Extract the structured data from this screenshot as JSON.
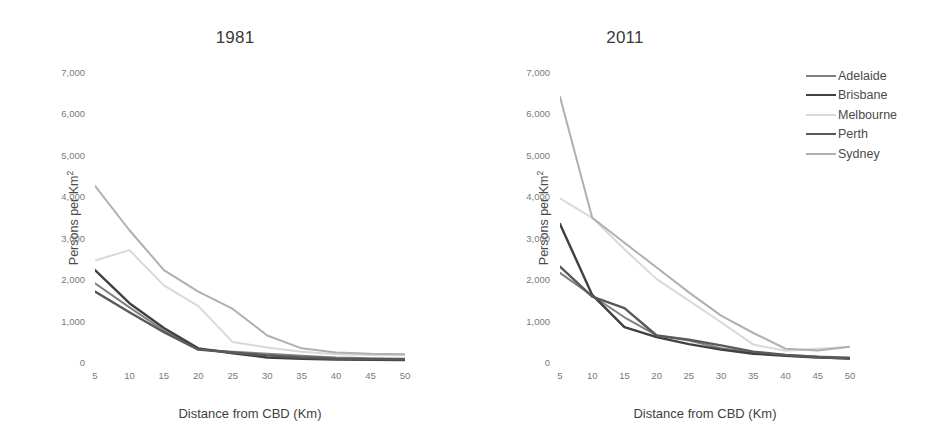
{
  "chart_data": [
    {
      "type": "line",
      "title": "1981",
      "xlabel": "Distance from CBD (Km)",
      "ylabel": "Persons per Km²",
      "x": [
        5,
        10,
        15,
        20,
        25,
        30,
        35,
        40,
        45,
        50
      ],
      "xlim": [
        5,
        50
      ],
      "ylim": [
        0,
        7000
      ],
      "yticks": [
        0,
        1000,
        2000,
        3000,
        4000,
        5000,
        6000,
        7000
      ],
      "ytick_labels": [
        "0",
        "1,000",
        "2,000",
        "3,000",
        "4,000",
        "5,000",
        "6,000",
        "7,000"
      ],
      "xticks": [
        5,
        10,
        15,
        20,
        25,
        30,
        35,
        40,
        45,
        50
      ],
      "xtick_labels": [
        "5",
        "10",
        "15",
        "20",
        "25",
        "30",
        "35",
        "40",
        "45",
        "50"
      ],
      "grid": false,
      "legend_position": "none",
      "series": [
        {
          "name": "Adelaide",
          "color": "#808080",
          "width": 2.0,
          "values": [
            1900,
            1320,
            760,
            300,
            250,
            200,
            150,
            110,
            90,
            80
          ]
        },
        {
          "name": "Brisbane",
          "color": "#404040",
          "width": 2.4,
          "values": [
            2220,
            1420,
            820,
            330,
            210,
            110,
            80,
            60,
            55,
            50
          ]
        },
        {
          "name": "Melbourne",
          "color": "#d9d9d9",
          "width": 2.0,
          "values": [
            2450,
            2700,
            1850,
            1350,
            480,
            350,
            250,
            190,
            170,
            165
          ]
        },
        {
          "name": "Perth",
          "color": "#595959",
          "width": 2.4,
          "values": [
            1700,
            1200,
            720,
            300,
            230,
            160,
            110,
            80,
            70,
            65
          ]
        },
        {
          "name": "Sydney",
          "color": "#b0b0b0",
          "width": 2.0,
          "values": [
            4250,
            3180,
            2220,
            1700,
            1280,
            640,
            330,
            230,
            200,
            190
          ]
        }
      ]
    },
    {
      "type": "line",
      "title": "2011",
      "xlabel": "Distance from CBD (Km)",
      "ylabel": "Persons per Km²",
      "x": [
        5,
        10,
        15,
        20,
        25,
        30,
        35,
        40,
        45,
        50
      ],
      "xlim": [
        5,
        50
      ],
      "ylim": [
        0,
        7000
      ],
      "yticks": [
        0,
        1000,
        2000,
        3000,
        4000,
        5000,
        6000,
        7000
      ],
      "ytick_labels": [
        "0",
        "1,000",
        "2,000",
        "3,000",
        "4,000",
        "5,000",
        "6,000",
        "7,000"
      ],
      "xticks": [
        5,
        10,
        15,
        20,
        25,
        30,
        35,
        40,
        45,
        50
      ],
      "xtick_labels": [
        "5",
        "10",
        "15",
        "20",
        "25",
        "30",
        "35",
        "40",
        "45",
        "50"
      ],
      "grid": false,
      "legend_position": "right",
      "series": [
        {
          "name": "Adelaide",
          "color": "#808080",
          "width": 2.0,
          "values": [
            2150,
            1600,
            1080,
            640,
            520,
            330,
            230,
            170,
            130,
            110
          ]
        },
        {
          "name": "Brisbane",
          "color": "#404040",
          "width": 2.4,
          "values": [
            3330,
            1620,
            840,
            600,
            430,
            300,
            200,
            150,
            110,
            90
          ]
        },
        {
          "name": "Melbourne",
          "color": "#d9d9d9",
          "width": 2.0,
          "values": [
            3950,
            3480,
            2720,
            2000,
            1480,
            960,
            420,
            270,
            320,
            370
          ]
        },
        {
          "name": "Perth",
          "color": "#595959",
          "width": 2.4,
          "values": [
            2300,
            1580,
            1300,
            640,
            540,
            400,
            250,
            170,
            120,
            80
          ]
        },
        {
          "name": "Sydney",
          "color": "#b0b0b0",
          "width": 2.0,
          "values": [
            6400,
            3480,
            2880,
            2280,
            1680,
            1120,
            700,
            320,
            280,
            370
          ]
        }
      ]
    }
  ],
  "legend": {
    "items": [
      {
        "label": "Adelaide",
        "color": "#808080",
        "width": 2.0
      },
      {
        "label": "Brisbane",
        "color": "#404040",
        "width": 2.6
      },
      {
        "label": "Melbourne",
        "color": "#d9d9d9",
        "width": 2.0
      },
      {
        "label": "Perth",
        "color": "#595959",
        "width": 2.6
      },
      {
        "label": "Sydney",
        "color": "#b0b0b0",
        "width": 2.0
      }
    ]
  }
}
